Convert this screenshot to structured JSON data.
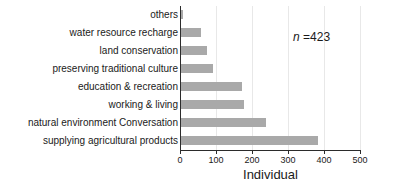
{
  "chart_data": {
    "type": "bar",
    "orientation": "horizontal",
    "title": "",
    "subtitle": "",
    "xlabel": "Individual",
    "ylabel": "",
    "xlim": [
      0,
      500
    ],
    "xticks": [
      0,
      100,
      200,
      300,
      400,
      500
    ],
    "xtick_labels": [
      "0",
      "100",
      "200",
      "300",
      "400",
      "500"
    ],
    "grid": true,
    "grid_axis": "x",
    "legend": false,
    "legend_position": "none",
    "bar_color": "#a9a9a9",
    "axis_color": "#2b2b2b",
    "gridline_color": "#e8e8e8",
    "categories": [
      "others",
      "water resource recharge",
      "land conservation",
      "preserving traditional culture",
      "education & recreation",
      "working & living",
      "natural environment Conversation",
      "supplying agricultural products"
    ],
    "values": [
      5,
      55,
      72,
      88,
      170,
      175,
      237,
      380
    ],
    "annotations": [
      {
        "name": "sample-size",
        "italic_part": "n",
        "rest": " =423",
        "text": "n =423"
      }
    ]
  }
}
